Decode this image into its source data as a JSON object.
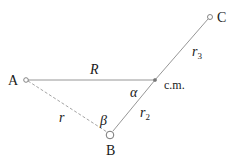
{
  "diagram": {
    "points": {
      "A": {
        "label": "A"
      },
      "B": {
        "label": "B"
      },
      "C": {
        "label": "C"
      },
      "cm": {
        "label": "c.m."
      }
    },
    "segments": {
      "R": {
        "label": "R",
        "from": "A",
        "to": "c.m.",
        "style": "solid"
      },
      "r": {
        "label": "r",
        "from": "A",
        "to": "B",
        "style": "dashed"
      },
      "r2": {
        "label": "r",
        "subscript": "2",
        "from": "B",
        "to": "c.m.",
        "style": "solid"
      },
      "r3": {
        "label": "r",
        "subscript": "3",
        "from": "c.m.",
        "to": "C",
        "style": "solid"
      }
    },
    "angles": {
      "alpha": {
        "label": "α",
        "at": "c.m."
      },
      "beta": {
        "label": "β",
        "at": "B"
      }
    },
    "colors": {
      "line": "#8a8a8a",
      "text": "#1a1a1a"
    }
  }
}
